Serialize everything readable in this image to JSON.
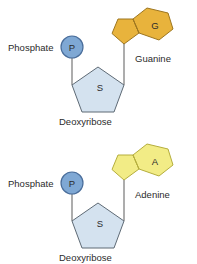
{
  "diagram": {
    "background_color": "#ffffff",
    "nucleotides": [
      {
        "id": "guanine-nucleotide",
        "phosphate": {
          "label": "Phosphate",
          "glyph": "P",
          "fill_color": "#7FA8D4",
          "stroke_color": "#4a6e9b"
        },
        "sugar": {
          "label": "Deoxyribose",
          "glyph": "S",
          "fill_color": "#D4E2EF",
          "stroke_color": "#5e6a75"
        },
        "base": {
          "label": "Guanine",
          "glyph": "G",
          "fill_color": "#E8B33C",
          "stroke_color": "#9d7620",
          "ring_type": "purine"
        }
      },
      {
        "id": "adenine-nucleotide",
        "phosphate": {
          "label": "Phosphate",
          "glyph": "P",
          "fill_color": "#7FA8D4",
          "stroke_color": "#4a6e9b"
        },
        "sugar": {
          "label": "Deoxyribose",
          "glyph": "S",
          "fill_color": "#D4E2EF",
          "stroke_color": "#5e6a75"
        },
        "base": {
          "label": "Adenine",
          "glyph": "A",
          "fill_color": "#F2EC86",
          "stroke_color": "#b5ae3d",
          "ring_type": "purine"
        }
      }
    ]
  }
}
